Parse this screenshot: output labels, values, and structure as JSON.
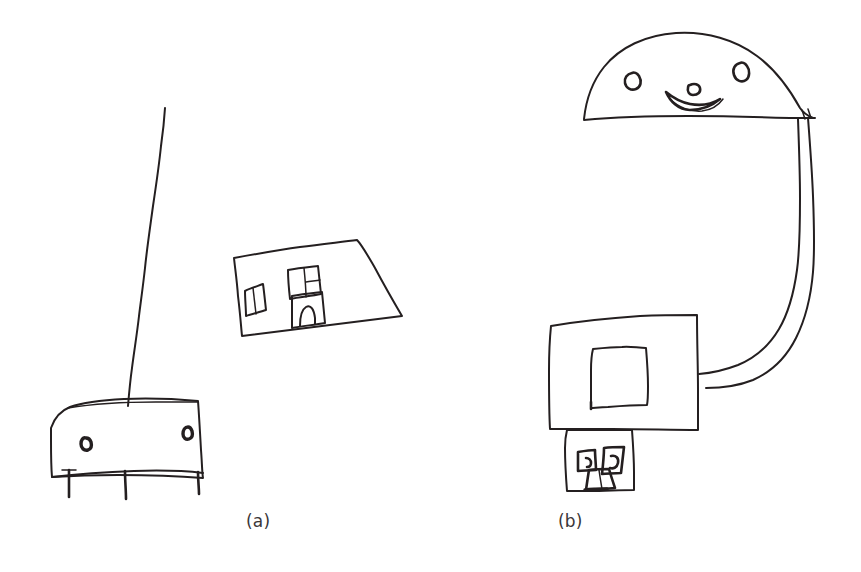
{
  "figure": {
    "background_color": "#ffffff",
    "ink_color": "#241f20",
    "width": 861,
    "height": 572,
    "medium": "hand-drawn pen sketch on white paper",
    "panels": [
      {
        "id": "a",
        "caption": "(a)",
        "caption_position": {
          "x": 246,
          "y": 511
        },
        "description": "Child's drawing: a tall vertical pole line, a tilted quadrilateral house with two windows and a door, and a lower wide vehicle-like shape with two small round marks and three short legs.",
        "elements": [
          {
            "name": "vertical-pole-line",
            "kind": "line"
          },
          {
            "name": "house-quadrilateral",
            "kind": "closed-shape"
          },
          {
            "name": "house-left-window",
            "kind": "closed-shape"
          },
          {
            "name": "house-upper-window",
            "kind": "closed-shape"
          },
          {
            "name": "house-door",
            "kind": "closed-shape"
          },
          {
            "name": "vehicle-body",
            "kind": "closed-shape"
          },
          {
            "name": "vehicle-left-wheel-mark",
            "kind": "small-circle"
          },
          {
            "name": "vehicle-right-wheel-mark",
            "kind": "small-circle"
          },
          {
            "name": "vehicle-legs",
            "kind": "short-lines",
            "count": 3
          }
        ]
      },
      {
        "id": "b",
        "caption": "(b)",
        "caption_position": {
          "x": 558,
          "y": 511
        },
        "description": "Child's drawing: a large dome/head with two oval eyes and a curved boat-shaped smiling mouth, a long double-line curved arm descending on the right and hooking left, a large square with a smaller square inside, and a small square face below with two square eyes and a trapezoid mouth.",
        "elements": [
          {
            "name": "dome-head",
            "kind": "closed-shape"
          },
          {
            "name": "dome-left-eye",
            "kind": "small-oval"
          },
          {
            "name": "dome-right-eye",
            "kind": "small-oval"
          },
          {
            "name": "dome-mouth",
            "kind": "curved-shape"
          },
          {
            "name": "curved-arm",
            "kind": "double-line-curve"
          },
          {
            "name": "big-square",
            "kind": "closed-shape"
          },
          {
            "name": "inner-square",
            "kind": "closed-shape"
          },
          {
            "name": "small-face-square",
            "kind": "closed-shape"
          },
          {
            "name": "face-left-eye",
            "kind": "small-square"
          },
          {
            "name": "face-right-eye",
            "kind": "small-square"
          },
          {
            "name": "face-mouth",
            "kind": "trapezoid"
          }
        ]
      }
    ]
  }
}
